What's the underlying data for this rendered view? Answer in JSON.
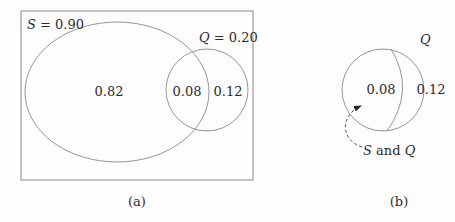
{
  "panel_a": {
    "caption": "(a)",
    "set_s": {
      "name": "S",
      "eq": " = 0.90"
    },
    "set_q": {
      "name": "Q",
      "eq": " = 0.20"
    },
    "regions": {
      "s_only": "0.82",
      "s_and_q": "0.08",
      "q_only": "0.12"
    }
  },
  "panel_b": {
    "caption": "(b)",
    "set_q": {
      "name": "Q"
    },
    "regions": {
      "s_and_q": "0.08",
      "q_only": "0.12"
    },
    "annotation": {
      "s": "S",
      "and": " and ",
      "q": "Q"
    }
  },
  "colors": {
    "stroke": "#8a8a8a",
    "text": "#2a2a2a",
    "background": "#fdfdfd"
  }
}
